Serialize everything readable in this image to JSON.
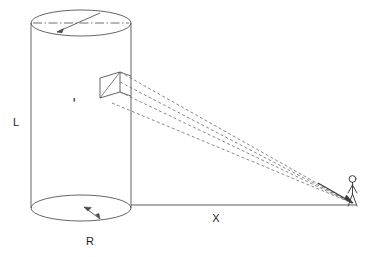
{
  "figure": {
    "kind": "technical-line-drawing",
    "caption_text": "",
    "background_color": "#ffffff",
    "stroke_color": "#4a4a4a",
    "label_color": "#1d1d1d",
    "dashed_stroke_color": "#6b6b6b",
    "labels": {
      "length": "L",
      "radius": "R",
      "distance": "X"
    },
    "objects": {
      "cylinder_name": "cylinder",
      "patch_name": "surface-patch",
      "observer_name": "observer",
      "ground_line_name": "ground-baseline"
    },
    "geometry": {
      "cylinder_left_x": 31,
      "cylinder_right_x": 131,
      "cylinder_top_center_y": 23,
      "cylinder_bottom_center_y": 208,
      "ellipse_semi_minor": 13,
      "patch_front_top": [
        100,
        78
      ],
      "patch_back_top": [
        120,
        72
      ],
      "patch_back_bottom": [
        120,
        92
      ],
      "patch_front_bottom": [
        100,
        98
      ],
      "observer_feet": [
        352,
        203
      ],
      "observer_head_y": 176,
      "baseline_y": 205,
      "label_L_pos": [
        16,
        126
      ],
      "label_R_pos": [
        90,
        245
      ],
      "label_X_pos": [
        216,
        222
      ]
    },
    "sight_line_count": 4
  }
}
